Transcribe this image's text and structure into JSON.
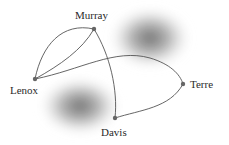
{
  "diagram": {
    "type": "network-graph",
    "nodes": [
      {
        "id": "murray",
        "label": "Murray",
        "x": 94,
        "y": 29,
        "label_x": 75,
        "label_y": 10
      },
      {
        "id": "lenox",
        "label": "Lenox",
        "x": 35,
        "y": 79,
        "label_x": 10,
        "label_y": 85
      },
      {
        "id": "terre",
        "label": "Terre",
        "x": 183,
        "y": 84,
        "label_x": 190,
        "label_y": 79
      },
      {
        "id": "davis",
        "label": "Davis",
        "x": 115,
        "y": 118,
        "label_x": 101,
        "label_y": 127
      }
    ],
    "edges": [
      {
        "from": "lenox",
        "to": "murray",
        "style": "outer-arc"
      },
      {
        "from": "lenox",
        "to": "murray",
        "style": "inner-arc"
      },
      {
        "from": "lenox",
        "to": "terre",
        "style": "arc"
      },
      {
        "from": "murray",
        "to": "davis",
        "style": "arc"
      },
      {
        "from": "davis",
        "to": "terre",
        "style": "arc"
      }
    ],
    "colors": {
      "edge": "#555555",
      "node": "#666666",
      "blob": "#5a5a5a",
      "text": "#2a2a2a"
    }
  }
}
